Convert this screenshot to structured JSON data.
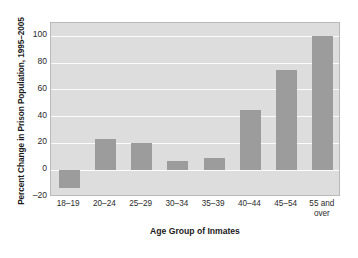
{
  "chart_data": {
    "type": "bar",
    "title": "",
    "categories": [
      "18–19",
      "20–24",
      "25–29",
      "30–34",
      "35–39",
      "40–44",
      "45–54",
      "55 and\nover"
    ],
    "values": [
      -13,
      23,
      20,
      7,
      9,
      45,
      75,
      100
    ],
    "xlabel": "Age Group of Inmates",
    "ylabel": "Percent Change in Prison Population, 1995–2005",
    "ylim": [
      -20,
      110
    ],
    "yticks": [
      100,
      80,
      60,
      40,
      20,
      0,
      -20
    ],
    "ytick_labels": [
      "100",
      "80",
      "60",
      "40",
      "20",
      "0",
      "–20"
    ],
    "grid": true,
    "legend": "none",
    "bar_color": "#9c9c9c",
    "plot_background": "#dddddd",
    "gridline_color": "#fbfbfb",
    "frame_color": "#b9b9b9",
    "figure_background": "#ffffff"
  }
}
